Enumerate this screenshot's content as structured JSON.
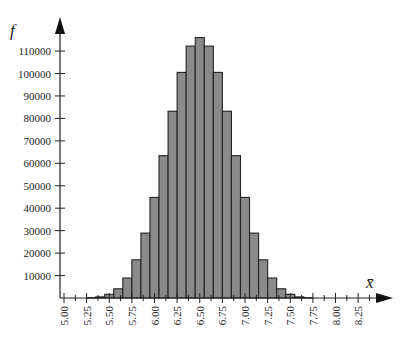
{
  "chart_data": {
    "type": "bar",
    "title": "",
    "xlabel": "x̄",
    "ylabel": "f",
    "bin_width": 0.1,
    "categories": [
      "5.3",
      "5.4",
      "5.5",
      "5.6",
      "5.7",
      "5.8",
      "5.9",
      "6.0",
      "6.1",
      "6.2",
      "6.3",
      "6.4",
      "6.5",
      "6.6",
      "6.7",
      "6.8",
      "6.9",
      "7.0",
      "7.1",
      "7.2",
      "7.3",
      "7.4",
      "7.5",
      "7.6",
      "7.7"
    ],
    "bin_centers": [
      5.3,
      5.4,
      5.5,
      5.6,
      5.7,
      5.8,
      5.9,
      6.0,
      6.1,
      6.2,
      6.3,
      6.4,
      6.5,
      6.6,
      6.7,
      6.8,
      6.9,
      7.0,
      7.1,
      7.2,
      7.3,
      7.4,
      7.5,
      7.6,
      7.7
    ],
    "values": [
      150,
      500,
      1650,
      4100,
      8900,
      17000,
      28900,
      44800,
      63400,
      83200,
      100500,
      112200,
      116000,
      112200,
      100500,
      83200,
      63400,
      44800,
      28900,
      17000,
      8900,
      4100,
      1650,
      500,
      150
    ],
    "x_ticks": [
      "5.00",
      "5.25",
      "5.50",
      "5.75",
      "6.00",
      "6.25",
      "6.50",
      "6.75",
      "7.00",
      "7.25",
      "7.50",
      "7.75",
      "8.00",
      "8.25"
    ],
    "x_tick_values": [
      5.0,
      5.25,
      5.5,
      5.75,
      6.0,
      6.25,
      6.5,
      6.75,
      7.0,
      7.25,
      7.5,
      7.75,
      8.0,
      8.25
    ],
    "y_ticks": [
      "10000",
      "20000",
      "30000",
      "40000",
      "50000",
      "60000",
      "70000",
      "80000",
      "90000",
      "100000",
      "110000"
    ],
    "y_tick_values": [
      10000,
      20000,
      30000,
      40000,
      50000,
      60000,
      70000,
      80000,
      90000,
      100000,
      110000
    ],
    "xlim": [
      4.95,
      8.5
    ],
    "ylim": [
      0,
      125000
    ],
    "grid": false,
    "legend": null
  },
  "style": {
    "bar_fill": "#8a8a8a",
    "bar_stroke": "#222222",
    "axis_color": "#222222"
  }
}
